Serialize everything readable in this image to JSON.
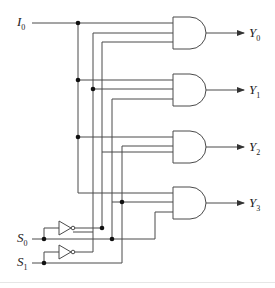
{
  "diagram": {
    "type": "4-to-1 demultiplexer logic circuit",
    "input": {
      "label": "I",
      "sub": "0"
    },
    "selects": [
      {
        "label": "S",
        "sub": "0"
      },
      {
        "label": "S",
        "sub": "1"
      }
    ],
    "outputs": [
      {
        "label": "Y",
        "sub": "0"
      },
      {
        "label": "Y",
        "sub": "1"
      },
      {
        "label": "Y",
        "sub": "2"
      },
      {
        "label": "Y",
        "sub": "3"
      }
    ],
    "gates": [
      {
        "type": "AND",
        "inputs": [
          "I0",
          "S1'",
          "S0'"
        ],
        "output": "Y0"
      },
      {
        "type": "AND",
        "inputs": [
          "I0",
          "S1'",
          "S0"
        ],
        "output": "Y1"
      },
      {
        "type": "AND",
        "inputs": [
          "I0",
          "S1",
          "S0'"
        ],
        "output": "Y2"
      },
      {
        "type": "AND",
        "inputs": [
          "I0",
          "S1",
          "S0"
        ],
        "output": "Y3"
      }
    ],
    "inverters": [
      {
        "input": "S0",
        "output": "S0'"
      },
      {
        "input": "S1",
        "output": "S1'"
      }
    ],
    "colors": {
      "line": "#4a4a4a",
      "dot": "#111111",
      "background": "#ffffff"
    }
  }
}
